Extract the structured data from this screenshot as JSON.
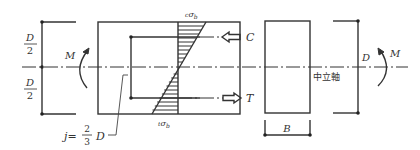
{
  "figure": {
    "colors": {
      "line": "#333333",
      "background": "#ffffff"
    }
  },
  "left_dimension": {
    "upper_label_num": "D",
    "upper_label_den": "2",
    "lower_label_num": "D",
    "lower_label_den": "2"
  },
  "left_moment": {
    "label": "M",
    "icon": "curved-arrow-up-icon"
  },
  "stress_diagram": {
    "top_stress_label_prefix": "c",
    "top_stress_label_symbol": "σ",
    "top_stress_label_sub": "b",
    "bottom_stress_label_prefix": "t",
    "bottom_stress_label_symbol": "σ",
    "bottom_stress_label_sub": "b",
    "compression_label": "C",
    "tension_label": "T",
    "compression_arrow_icon": "hollow-arrow-left-icon",
    "tension_arrow_icon": "hollow-arrow-right-icon"
  },
  "lever_arm": {
    "prefix": "j=",
    "frac_num": "2",
    "frac_den": "3",
    "suffix": "D"
  },
  "cross_section": {
    "width_label": "B",
    "neutral_axis_label": "中立軸"
  },
  "right_dimension": {
    "label": "D"
  },
  "right_moment": {
    "label": "M",
    "icon": "curved-arrow-up-icon"
  }
}
